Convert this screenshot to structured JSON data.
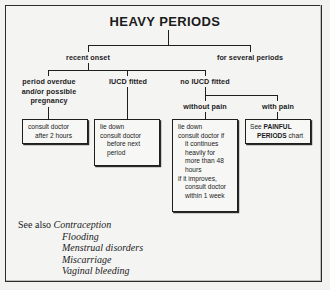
{
  "chart": {
    "title": "HEAVY PERIODS",
    "level1": [
      {
        "id": "recent-onset",
        "label": "recent onset"
      },
      {
        "id": "for-several-periods",
        "label": "for several periods"
      }
    ],
    "level2": [
      {
        "id": "period-overdue",
        "line1": "period overdue",
        "line2": "and/or possible",
        "line3": "pregnancy"
      },
      {
        "id": "iucd-fitted",
        "line1": "IUCD fitted"
      },
      {
        "id": "no-iucd-fitted",
        "line1": "no IUCD fitted"
      }
    ],
    "level3": [
      {
        "id": "without-pain",
        "label": "without pain"
      },
      {
        "id": "with-pain",
        "label": "with pain"
      }
    ],
    "boxes": [
      {
        "id": "box-period-overdue",
        "lines": [
          {
            "text": "consult doctor",
            "indent": 0
          },
          {
            "text": "after 2 hours",
            "indent": 1
          }
        ]
      },
      {
        "id": "box-iucd-fitted",
        "lines": [
          {
            "text": "lie down",
            "indent": 0
          },
          {
            "text": "consult doctor",
            "indent": 0
          },
          {
            "text": "before next",
            "indent": 1
          },
          {
            "text": "period",
            "indent": 1
          }
        ]
      },
      {
        "id": "box-without-pain",
        "lines": [
          {
            "text": "lie down",
            "indent": 0
          },
          {
            "text": "consult doctor if",
            "indent": 0
          },
          {
            "text": "it continues",
            "indent": 1
          },
          {
            "text": "heavily for",
            "indent": 1
          },
          {
            "text": "more than 48",
            "indent": 1
          },
          {
            "text": "hours",
            "indent": 1
          },
          {
            "text": "if it improves,",
            "indent": 0
          },
          {
            "text": "consult doctor",
            "indent": 1
          },
          {
            "text": "within 1 week",
            "indent": 1
          }
        ]
      },
      {
        "id": "box-with-pain",
        "ref_prefix": "See ",
        "ref_name": "PAINFUL",
        "ref_name2": "PERIODS",
        "ref_suffix": " chart"
      }
    ],
    "see_also": {
      "lead": "See also",
      "items": [
        "Contraception",
        "Flooding",
        "Menstrual disorders",
        "Miscarriage",
        "Vaginal bleeding"
      ]
    }
  }
}
